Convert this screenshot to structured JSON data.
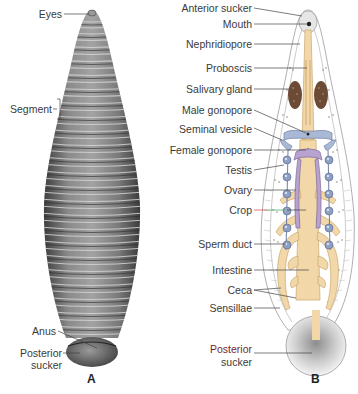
{
  "figure": {
    "panels": [
      {
        "id": "A",
        "letter": "A",
        "description": "External dorsal view of leech",
        "labels": [
          {
            "key": "eyes",
            "text": "Eyes"
          },
          {
            "key": "segment",
            "text": "Segment"
          },
          {
            "key": "anus",
            "text": "Anus"
          },
          {
            "key": "posterior_sucker_1",
            "text": "Posterior"
          },
          {
            "key": "posterior_sucker_2",
            "text": "sucker"
          }
        ]
      },
      {
        "id": "B",
        "letter": "B",
        "description": "Internal anatomy of leech",
        "labels": [
          {
            "key": "anterior_sucker",
            "text": "Anterior sucker"
          },
          {
            "key": "mouth",
            "text": "Mouth"
          },
          {
            "key": "nephridiopore",
            "text": "Nephridiopore"
          },
          {
            "key": "proboscis",
            "text": "Proboscis"
          },
          {
            "key": "salivary_gland",
            "text": "Salivary gland"
          },
          {
            "key": "male_gonopore",
            "text": "Male gonopore"
          },
          {
            "key": "seminal_vesicle",
            "text": "Seminal vesicle"
          },
          {
            "key": "female_gonopore",
            "text": "Female gonopore"
          },
          {
            "key": "testis",
            "text": "Testis"
          },
          {
            "key": "ovary",
            "text": "Ovary"
          },
          {
            "key": "crop",
            "text": "Crop"
          },
          {
            "key": "sperm_duct",
            "text": "Sperm duct"
          },
          {
            "key": "intestine",
            "text": "Intestine"
          },
          {
            "key": "ceca",
            "text": "Ceca"
          },
          {
            "key": "sensillae",
            "text": "Sensillae"
          },
          {
            "key": "posterior_sucker_1",
            "text": "Posterior"
          },
          {
            "key": "posterior_sucker_2",
            "text": "sucker"
          }
        ]
      }
    ],
    "colors": {
      "body_gray": "#7d7d7d",
      "body_dark": "#4a4a4a",
      "gut_tan": "#f2d8a8",
      "gut_edge": "#c9a66b",
      "reproductive_purple": "#b8a2cf",
      "testis_blue": "#8e9fc4",
      "salivary_brown": "#6b4a36",
      "seminal_blue": "#a9b8d4",
      "crop_label_line": "#d23a3a"
    }
  }
}
